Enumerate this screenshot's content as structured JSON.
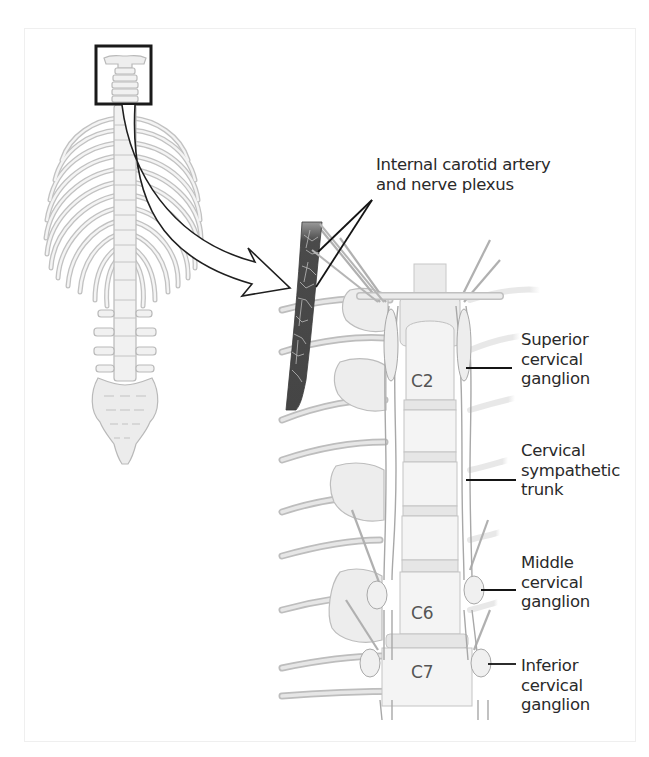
{
  "figure": {
    "type": "anatomical-illustration",
    "overview_inset": {
      "description": "Full spine with rib cage; cervical region highlighted by box",
      "highlight_box": "cervical-spine"
    },
    "labels": {
      "carotid": [
        "Internal carotid artery",
        "and nerve plexus"
      ],
      "superior": [
        "Superior",
        "cervical",
        "ganglion"
      ],
      "trunk": [
        "Cervical",
        "sympathetic",
        "trunk"
      ],
      "middle": [
        "Middle",
        "cervical",
        "ganglion"
      ],
      "inferior": [
        "Inferior",
        "cervical",
        "ganglion"
      ]
    },
    "vertebra_labels": {
      "c2": "C2",
      "c6": "C6",
      "c7": "C7"
    },
    "colors": {
      "bone_fill": "#ececec",
      "bone_stroke": "#b5b5b5",
      "artery": "#4a4a4a",
      "leader_line": "#1a1a1a",
      "text": "#2a2a2a"
    }
  }
}
